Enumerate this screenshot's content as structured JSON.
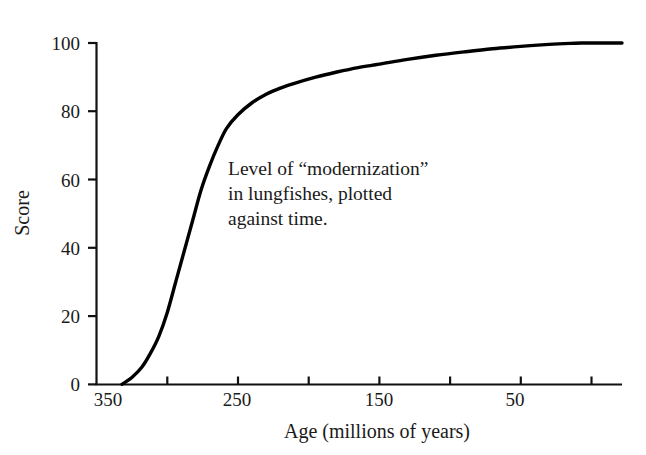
{
  "chart_data": {
    "type": "line",
    "title": "",
    "xlabel": "Age (millions of years)",
    "ylabel": "Score",
    "xlim": [
      355,
      0
    ],
    "ylim": [
      0,
      100
    ],
    "x_inverted": true,
    "grid": false,
    "legend": "none",
    "annotations": [
      {
        "name": "caption",
        "lines": [
          "Level of “modernization”",
          "in lungfishes, plotted",
          "against time."
        ]
      }
    ],
    "xticks": [
      350,
      300,
      250,
      200,
      150,
      100,
      50,
      0
    ],
    "xtick_labels": [
      "350",
      "",
      "250",
      "",
      "150",
      "",
      "50",
      ""
    ],
    "yticks": [
      0,
      20,
      40,
      60,
      80,
      100
    ],
    "ytick_labels": [
      "0",
      "20",
      "40",
      "60",
      "80",
      "100"
    ],
    "series": [
      {
        "name": "modernization-score",
        "x": [
          332,
          325,
          318,
          312,
          306,
          300,
          294,
          288,
          282,
          276,
          270,
          264,
          258,
          250,
          240,
          230,
          220,
          210,
          195,
          180,
          165,
          150,
          130,
          110,
          90,
          70,
          50,
          30,
          15,
          5
        ],
        "y": [
          0,
          2,
          5,
          9,
          14,
          21,
          30,
          39,
          48,
          57,
          64,
          70,
          75,
          79,
          82.5,
          85,
          86.8,
          88.2,
          90,
          91.5,
          92.8,
          93.8,
          95.2,
          96.4,
          97.4,
          98.3,
          99.0,
          99.6,
          99.9,
          100
        ]
      }
    ]
  },
  "axis": {
    "x_title": "Age (millions of years)",
    "y_title": "Score"
  },
  "labels": {
    "y": [
      "100",
      "80",
      "60",
      "40",
      "20",
      "0"
    ],
    "x": [
      "350",
      "250",
      "150",
      "50"
    ]
  },
  "annotation": {
    "line1": "Level of “modernization”",
    "line2": "in lungfishes, plotted",
    "line3": "against time."
  },
  "colors": {
    "curve": "#000000",
    "axis": "#1a1a1a",
    "background": "#ffffff",
    "text": "#1a1a1a"
  }
}
